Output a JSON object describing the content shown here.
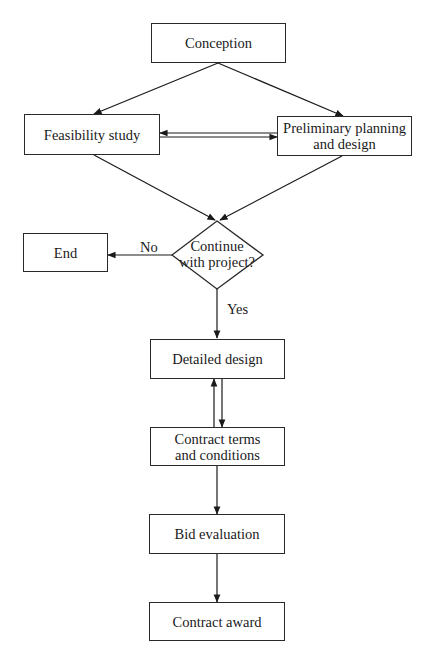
{
  "diagram": {
    "type": "flowchart",
    "nodes": {
      "conception": {
        "label": "Conception",
        "shape": "rectangle"
      },
      "feasibility": {
        "label": "Feasibility study",
        "shape": "rectangle"
      },
      "preliminary": {
        "label_line1": "Preliminary planning",
        "label_line2": "and design",
        "shape": "rectangle"
      },
      "decision": {
        "label_line1": "Continue",
        "label_line2": "with project?",
        "shape": "diamond"
      },
      "end": {
        "label": "End",
        "shape": "rectangle"
      },
      "detailed_design": {
        "label": "Detailed design",
        "shape": "rectangle"
      },
      "contract_terms": {
        "label_line1": "Contract terms",
        "label_line2": "and conditions",
        "shape": "rectangle"
      },
      "bid_evaluation": {
        "label": "Bid evaluation",
        "shape": "rectangle"
      },
      "contract_award": {
        "label": "Contract award",
        "shape": "rectangle"
      }
    },
    "edges": [
      {
        "from": "Conception",
        "to": "Feasibility study"
      },
      {
        "from": "Conception",
        "to": "Preliminary planning and design"
      },
      {
        "from": "Feasibility study",
        "to": "Preliminary planning and design"
      },
      {
        "from": "Preliminary planning and design",
        "to": "Feasibility study"
      },
      {
        "from": "Feasibility study",
        "to": "Continue with project?"
      },
      {
        "from": "Preliminary planning and design",
        "to": "Continue with project?"
      },
      {
        "from": "Continue with project?",
        "to": "End",
        "label": "No"
      },
      {
        "from": "Continue with project?",
        "to": "Detailed design",
        "label": "Yes"
      },
      {
        "from": "Detailed design",
        "to": "Contract terms and conditions"
      },
      {
        "from": "Contract terms and conditions",
        "to": "Detailed design"
      },
      {
        "from": "Contract terms and conditions",
        "to": "Bid evaluation"
      },
      {
        "from": "Bid evaluation",
        "to": "Contract award"
      }
    ],
    "edge_labels": {
      "no": "No",
      "yes": "Yes"
    },
    "colors": {
      "stroke": "#2a2a2a",
      "background": "#ffffff",
      "text": "#1a1a1a"
    }
  }
}
